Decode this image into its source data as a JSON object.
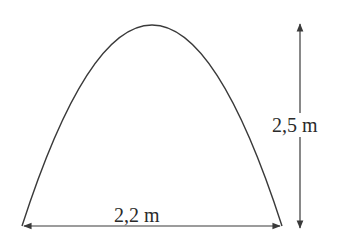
{
  "diagram": {
    "shape": "parabolic-arch",
    "width_label": "2,2 m",
    "height_label": "2,5 m",
    "stroke_color": "#3a3a3a",
    "background": "#ffffff"
  }
}
